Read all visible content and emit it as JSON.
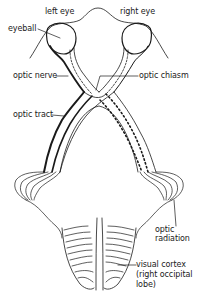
{
  "diagram": {
    "colors": {
      "line": "#1a1a1a",
      "background": "#ffffff"
    },
    "labels": {
      "left_eye": "left eye",
      "right_eye": "right eye",
      "eyeball": "eyeball",
      "optic_nerve": "optic nerve",
      "optic_chiasm": "optic chiasm",
      "optic_tract": "optic tract",
      "optic_radiation_line1": "optic",
      "optic_radiation_line2": "radiation",
      "visual_cortex_line1": "visual cortex",
      "visual_cortex_line2": "(right occipital",
      "visual_cortex_line3": "lobe)"
    }
  }
}
